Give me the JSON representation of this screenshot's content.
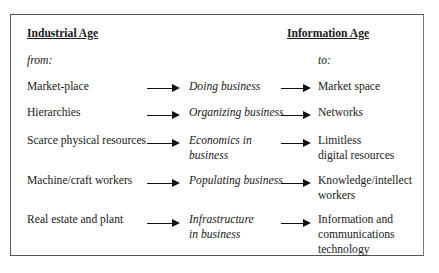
{
  "headers": {
    "left": "Industrial Age",
    "right": "Information Age"
  },
  "subheaders": {
    "left": "from:",
    "right": "to:"
  },
  "rows": [
    {
      "from": [
        "Market-place"
      ],
      "via": [
        "Doing business"
      ],
      "to": [
        "Market space"
      ]
    },
    {
      "from": [
        "Hierarchies"
      ],
      "via": [
        "Organizing business"
      ],
      "to": [
        "Networks"
      ]
    },
    {
      "from": [
        "Scarce physical resources"
      ],
      "via": [
        "Economics in",
        "business"
      ],
      "to": [
        "Limitless",
        "digital resources"
      ]
    },
    {
      "from": [
        "Machine/craft workers"
      ],
      "via": [
        "Populating business"
      ],
      "to": [
        "Knowledge/intellect",
        "workers"
      ]
    },
    {
      "from": [
        "Real estate and plant"
      ],
      "via": [
        "Infrastructure",
        "in business"
      ],
      "to": [
        "Information and",
        "communications",
        "technology"
      ]
    }
  ],
  "icons": {
    "arrow": "right-arrow-icon"
  },
  "colors": {
    "text": "#1a1a1a",
    "border": "#555555",
    "background": "#ffffff"
  }
}
